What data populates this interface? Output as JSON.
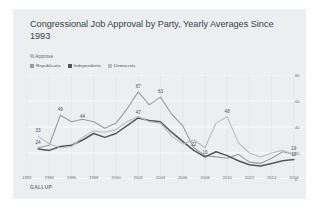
{
  "card": {
    "title": "Congressional Job Approval by Party, Yearly Averages Since 1993",
    "axis_note": "% Approve",
    "source": "GALLUP",
    "background": "#eceef0"
  },
  "legend": {
    "position": "top-left",
    "items": [
      {
        "label": "Republicans",
        "color": "#9a9da0"
      },
      {
        "label": "Independents",
        "color": "#55585b"
      },
      {
        "label": "Democrats",
        "color": "#b9bcbf"
      }
    ]
  },
  "chart_data": {
    "type": "line",
    "title": "Congressional Job Approval by Party, Yearly Averages Since 1993",
    "xlabel": "",
    "ylabel": "% Approve",
    "ylim": [
      0,
      80
    ],
    "yticks": [
      0,
      20,
      40,
      60,
      80
    ],
    "xlim": [
      1992,
      2017
    ],
    "xticks": [
      1992,
      1994,
      1996,
      1998,
      2000,
      2002,
      2004,
      2006,
      2008,
      2010,
      2012,
      2014,
      2016
    ],
    "grid": true,
    "x": [
      1993,
      1994,
      1995,
      1996,
      1997,
      1998,
      1999,
      2000,
      2001,
      2002,
      2003,
      2004,
      2005,
      2006,
      2007,
      2008,
      2009,
      2010,
      2011,
      2012,
      2013,
      2014,
      2015,
      2016
    ],
    "series": [
      {
        "name": "Republicans",
        "color": "#9a9da0",
        "values": [
          24,
          26,
          49,
          44,
          46,
          44,
          39,
          43,
          54,
          67,
          57,
          63,
          50,
          41,
          24,
          18,
          17,
          16,
          19,
          13,
          12,
          16,
          21,
          19
        ]
      },
      {
        "name": "Independents",
        "color": "#55585b",
        "values": [
          23,
          22,
          25,
          26,
          30,
          35,
          32,
          35,
          41,
          47,
          45,
          44,
          36,
          29,
          22,
          17,
          21,
          18,
          14,
          11,
          10,
          12,
          14,
          15
        ]
      },
      {
        "name": "Democrats",
        "color": "#b9bcbf",
        "values": [
          33,
          27,
          24,
          25,
          32,
          37,
          36,
          38,
          44,
          48,
          44,
          43,
          33,
          27,
          30,
          24,
          43,
          48,
          28,
          20,
          17,
          20,
          22,
          19
        ]
      }
    ],
    "point_labels": [
      {
        "series": "Democrats",
        "x": 1993,
        "y": 33,
        "text": "33"
      },
      {
        "series": "Republicans",
        "x": 1993,
        "y": 24,
        "text": "24"
      },
      {
        "series": "Republicans",
        "x": 1995,
        "y": 49,
        "text": "49"
      },
      {
        "series": "Republicans",
        "x": 1997,
        "y": 44,
        "text": "44"
      },
      {
        "series": "Independents",
        "x": 2002,
        "y": 47,
        "text": "47"
      },
      {
        "series": "Republicans",
        "x": 2002,
        "y": 67,
        "text": "67"
      },
      {
        "series": "Republicans",
        "x": 2004,
        "y": 63,
        "text": "63"
      },
      {
        "series": "Independents",
        "x": 2007,
        "y": 22,
        "text": "22"
      },
      {
        "series": "Independents",
        "x": 2008,
        "y": 16,
        "text": "16"
      },
      {
        "series": "Democrats",
        "x": 2010,
        "y": 48,
        "text": "48"
      },
      {
        "series": "Republicans",
        "x": 2016,
        "y": 19,
        "text": "19"
      },
      {
        "series": "Independents",
        "x": 2016,
        "y": 15,
        "text": "15"
      }
    ]
  }
}
